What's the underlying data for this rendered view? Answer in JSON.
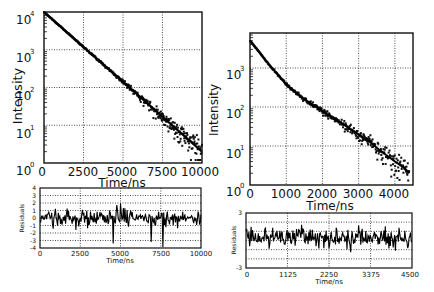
{
  "chart_data": [
    {
      "panel": "top-left",
      "type": "scatter",
      "title": "",
      "xlabel": "Time/ns",
      "ylabel": "Intensity",
      "yscale": "log",
      "xlim": [
        0,
        10000
      ],
      "ylim": [
        1,
        10000
      ],
      "xticks": [
        "0",
        "2500",
        "5000",
        "7500",
        "10000"
      ],
      "yticks": [
        "10^0",
        "10^1",
        "10^2",
        "10^3",
        "10^4"
      ],
      "grid": true,
      "series": [
        {
          "name": "data",
          "style": "points",
          "x": [
            0,
            500,
            1000,
            1500,
            2000,
            2500,
            3000,
            3500,
            4000,
            4500,
            5000,
            5500,
            6000,
            6500,
            7000,
            7500,
            8000,
            8500,
            9000,
            9500,
            10000
          ],
          "y": [
            10000,
            6800,
            4600,
            3100,
            2100,
            1400,
            950,
            640,
            430,
            290,
            195,
            130,
            90,
            60,
            40,
            27,
            18,
            12,
            8,
            5,
            3
          ]
        },
        {
          "name": "fit",
          "style": "line",
          "x": [
            0,
            10000
          ],
          "y": [
            10000,
            2
          ]
        }
      ]
    },
    {
      "panel": "bottom-left",
      "type": "line",
      "xlabel": "Time/ns",
      "ylabel": "Residuals",
      "xlim": [
        0,
        10000
      ],
      "ylim": [
        -4,
        4
      ],
      "xticks": [
        "0",
        "2500",
        "5000",
        "7500",
        "10000"
      ],
      "yticks": [
        "4",
        "3",
        "2",
        "1",
        "0",
        "-1",
        "-2",
        "-3",
        "-4"
      ],
      "grid": true,
      "series": [
        {
          "name": "residuals",
          "description": "random noise around 0, mostly within ±2, spikes to -4 near 7700 ns"
        }
      ]
    },
    {
      "panel": "top-right",
      "type": "scatter",
      "xlabel": "Time/ns",
      "ylabel": "Intensity",
      "yscale": "log",
      "xlim": [
        0,
        4500
      ],
      "ylim": [
        1,
        7000
      ],
      "xticks": [
        "0",
        "1000",
        "2000",
        "3000",
        "4000"
      ],
      "yticks": [
        "10^0",
        "10^1",
        "10^2",
        "10^3"
      ],
      "grid": true,
      "series": [
        {
          "name": "data",
          "style": "points",
          "x": [
            0,
            250,
            500,
            750,
            1000,
            1250,
            1500,
            1750,
            2000,
            2250,
            2500,
            2750,
            3000,
            3250,
            3500,
            3750,
            4000,
            4250,
            4400
          ],
          "y": [
            5000,
            2600,
            1300,
            700,
            380,
            240,
            160,
            110,
            80,
            55,
            40,
            28,
            20,
            14,
            9,
            6,
            4,
            2.8,
            2
          ]
        },
        {
          "name": "fit",
          "style": "line",
          "x": [
            0,
            4400
          ],
          "y": [
            5000,
            2
          ]
        }
      ]
    },
    {
      "panel": "bottom-right",
      "type": "line",
      "xlabel": "Time/ns",
      "ylabel": "Residuals",
      "xlim": [
        0,
        4500
      ],
      "ylim": [
        -3,
        3
      ],
      "xticks": [
        "0",
        "1125",
        "2250",
        "3375",
        "4500"
      ],
      "yticks": [
        "3",
        "-3"
      ],
      "grid": true,
      "series": [
        {
          "name": "residuals",
          "description": "random noise around 0, mostly within ±2"
        }
      ]
    }
  ],
  "labels": {
    "intensity": "Intensity",
    "time": "Time/ns",
    "residuals": "Residuals",
    "sup0": "0",
    "sup1": "1",
    "sup2": "2",
    "sup3": "3",
    "sup4": "4",
    "ten": "10",
    "tl_x": [
      "0",
      "2500",
      "5000",
      "7500",
      "10000"
    ],
    "tr_x": [
      "0",
      "1000",
      "2000",
      "3000",
      "4000"
    ],
    "bl_x": [
      "0",
      "2500",
      "5000",
      "7500",
      "10000"
    ],
    "br_x": [
      "0",
      "1125",
      "2250",
      "3375",
      "4500"
    ],
    "bl_y": [
      "4",
      "3",
      "2",
      "1",
      "0",
      "-1",
      "-2",
      "-3",
      "-4"
    ],
    "br_y": [
      "3",
      "-3"
    ]
  }
}
